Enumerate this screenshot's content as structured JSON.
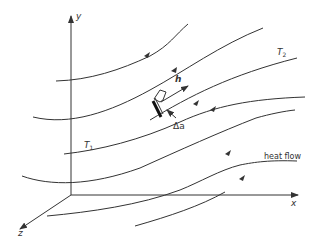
{
  "diagram": {
    "axes": {
      "y_label": "y",
      "x_label": "x",
      "z_label": "z"
    },
    "labels": {
      "h": "h",
      "delta_a": "Δa",
      "t1": "T",
      "t1_sub": "1",
      "t2": "T",
      "t2_sub": "2",
      "heat_flow": "heat flow"
    },
    "colors": {
      "line": "#333333",
      "background": "#ffffff"
    }
  }
}
